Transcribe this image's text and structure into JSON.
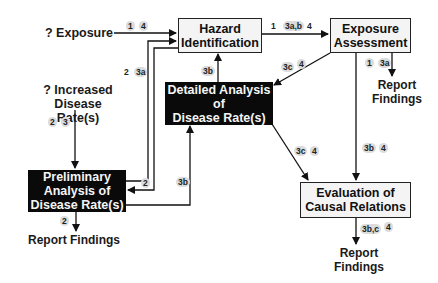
{
  "boxes": {
    "hazard": "Hazard\nIdentification",
    "exposure": "Exposure\nAssessment",
    "detailed": "Detailed Analysis\nof\nDisease Rate(s)",
    "preliminary": "Preliminary\nAnalysis of\nDisease Rate(s)",
    "evaluation": "Evaluation of\nCausal Relations"
  },
  "inputs": {
    "exposure": "? Exposure",
    "disease": "? Increased Disease\nRate(s)"
  },
  "outputs": {
    "exposure_report": "Report\nFindings",
    "preliminary_report": "Report Findings",
    "evaluation_report": "Report\nFindings"
  },
  "tags": {
    "exposure_to_hazard_1": "1",
    "exposure_to_hazard_2": "4",
    "prelim_to_hazard_1": "2",
    "prelim_to_hazard_2": "3a",
    "hazard_to_exposure_1": "1",
    "hazard_to_exposure_2": "3a,b",
    "hazard_to_exposure_3": "4",
    "detailed_to_hazard": "3b",
    "exposure_to_detailed_1": "3c",
    "exposure_to_detailed_2": "4",
    "exposure_report_1": "1",
    "exposure_report_2": "3a",
    "disease_in_1": "2",
    "disease_in_2": "3",
    "hazard_to_prelim": "2",
    "prelim_to_detailed": "3b",
    "detailed_to_eval_1": "3c",
    "detailed_to_eval_2": "4",
    "exposure_to_eval_1": "3b",
    "exposure_to_eval_2": "4",
    "prelim_report": "2",
    "eval_report_1": "3b,c",
    "eval_report_2": "4"
  },
  "colors": {
    "line": "#111111",
    "black_box": "#0a0a0a",
    "white_box": "#f4f4f4",
    "tag_bg": "#dcdcdc"
  }
}
